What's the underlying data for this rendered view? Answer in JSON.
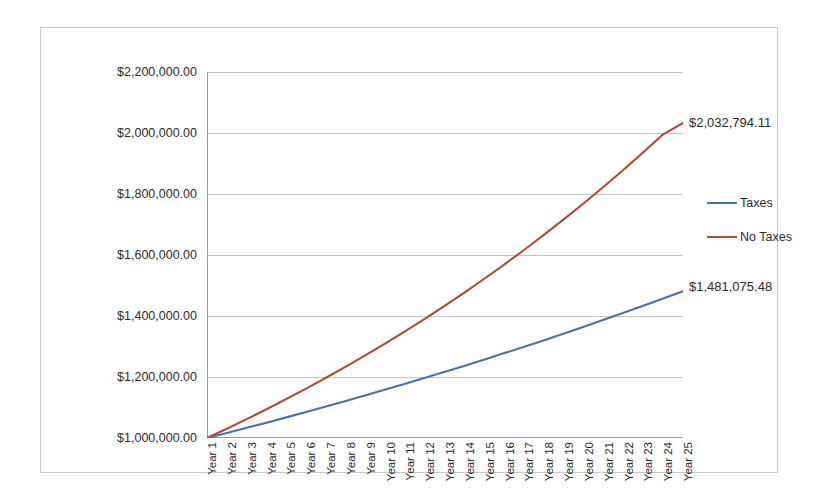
{
  "chart_data": {
    "type": "line",
    "title": "",
    "xlabel": "",
    "ylabel": "",
    "ylim": [
      1000000,
      2200000
    ],
    "grid": true,
    "legend_position": "right",
    "categories": [
      "Year 1",
      "Year 2",
      "Year 3",
      "Year 4",
      "Year 5",
      "Year 6",
      "Year 7",
      "Year 8",
      "Year 9",
      "Year 10",
      "Year 11",
      "Year 12",
      "Year 13",
      "Year 14",
      "Year 15",
      "Year 16",
      "Year 17",
      "Year 18",
      "Year 19",
      "Year 20",
      "Year 21",
      "Year 22",
      "Year 23",
      "Year 24",
      "Year 25"
    ],
    "ytick_labels": [
      "$2,200,000.00",
      "$2,000,000.00",
      "$1,800,000.00",
      "$1,600,000.00",
      "$1,400,000.00",
      "$1,200,000.00",
      "$1,000,000.00"
    ],
    "ytick_values": [
      2200000,
      2000000,
      1800000,
      1600000,
      1400000,
      1200000,
      1000000
    ],
    "series": [
      {
        "name": "Taxes",
        "color": "#4A71A8",
        "end_label": "$1,481,075.48",
        "values": [
          1000000,
          1016500,
          1033273,
          1050323,
          1067654,
          1085272,
          1103181,
          1121386,
          1139892,
          1158705,
          1177829,
          1197270,
          1217033,
          1237124,
          1257547,
          1278310,
          1299416,
          1320873,
          1342687,
          1364862,
          1387406,
          1410324,
          1433624,
          1457310,
          1481075
        ]
      },
      {
        "name": "No Taxes",
        "color": "#B04A36",
        "end_label": "$2,032,794.11",
        "values": [
          1000000,
          1030500,
          1061930,
          1094320,
          1127697,
          1162094,
          1197538,
          1234064,
          1271703,
          1310490,
          1350460,
          1391649,
          1434093,
          1477833,
          1522906,
          1569354,
          1617220,
          1666545,
          1717375,
          1769755,
          1823733,
          1879357,
          1936678,
          1995747,
          2032794
        ]
      }
    ],
    "legend": [
      {
        "label": "Taxes",
        "color": "#4A71A8"
      },
      {
        "label": "No Taxes",
        "color": "#B04A36"
      }
    ],
    "colors": {
      "taxes": "#4A71A8",
      "no_taxes": "#B04A36",
      "gridline": "#c4c4c4",
      "axis": "#9a9a9a",
      "frame": "#c9c9c9",
      "text": "#2b2b2b"
    }
  }
}
